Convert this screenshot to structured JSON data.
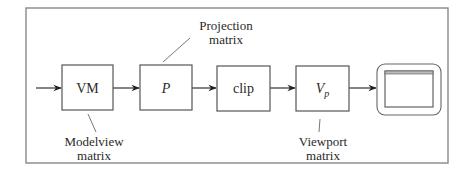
{
  "diagram": {
    "title": "",
    "stages": [
      {
        "id": "vm",
        "label": "VM",
        "italic": false
      },
      {
        "id": "p",
        "label": "P",
        "italic": true
      },
      {
        "id": "clip",
        "label": "clip",
        "italic": false
      },
      {
        "id": "vp",
        "label": "V",
        "subscript": "p",
        "italic": true
      }
    ],
    "annotations": {
      "projection": {
        "line1": "Projection",
        "line2": "matrix"
      },
      "modelview": {
        "line1": "Modelview",
        "line2": "matrix"
      },
      "viewport": {
        "line1": "Viewport",
        "line2": "matrix"
      }
    },
    "output_device": "monitor-icon",
    "colors": {
      "stroke": "#555555",
      "frame": "#888888",
      "text": "#2a2a2a"
    }
  }
}
